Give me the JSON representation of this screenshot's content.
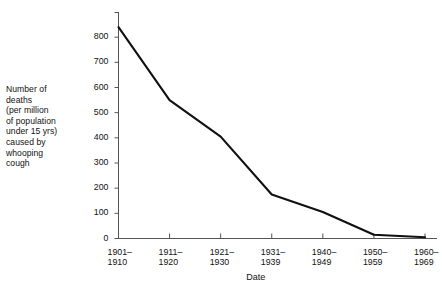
{
  "chart_data": {
    "type": "line",
    "title": "",
    "subtitle": "",
    "xlabel": "Date",
    "ylabel": "Number of\ndeaths\n(per million\nof population\nunder 15 yrs)\ncaused by\nwhooping\ncough",
    "categories": [
      "1901–\n1910",
      "1911–\n1920",
      "1921–\n1930",
      "1931–\n1939",
      "1940–\n1949",
      "1950–\n1959",
      "1960–\n1969"
    ],
    "categories_flat": [
      "1901–1910",
      "1911–1920",
      "1921–1930",
      "1931–1939",
      "1940–1949",
      "1950–1959",
      "1960–1969"
    ],
    "values": [
      840,
      550,
      405,
      175,
      105,
      15,
      5
    ],
    "ylim": [
      0,
      900
    ],
    "ytick_values": [
      0,
      100,
      200,
      300,
      400,
      500,
      600,
      700,
      800
    ],
    "ytick_labels": [
      "0",
      "100",
      "200",
      "300",
      "400",
      "500",
      "600",
      "700",
      "800"
    ],
    "grid": false,
    "legend": null,
    "line_color": "#111111",
    "axis_color": "#555555",
    "background": "#ffffff",
    "series": [
      {
        "name": "Whooping cough deaths per million under 15 yrs",
        "values": [
          840,
          550,
          405,
          175,
          105,
          15,
          5
        ]
      }
    ]
  }
}
